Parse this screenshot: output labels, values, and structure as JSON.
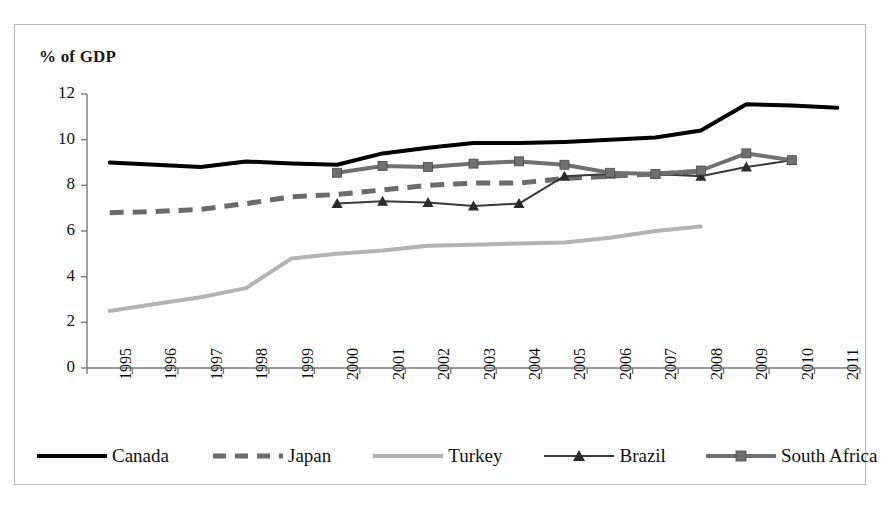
{
  "chart_data": {
    "type": "line",
    "title": "",
    "ylabel": "% of GDP",
    "xlabel": "",
    "ylim": [
      0,
      12
    ],
    "ytick_step": 2,
    "yticks": [
      "0",
      "2",
      "4",
      "6",
      "8",
      "10",
      "12"
    ],
    "grid": false,
    "legend_position": "bottom",
    "categories": [
      "1995",
      "1996",
      "1997",
      "1998",
      "1999",
      "2000",
      "2001",
      "2002",
      "2003",
      "2004",
      "2005",
      "2006",
      "2007",
      "2008",
      "2009",
      "2010",
      "2011"
    ],
    "series": [
      {
        "name": "Canada",
        "color": "#000000",
        "style": "solid",
        "marker": "none",
        "width": 4,
        "x": [
          "1995",
          "1996",
          "1997",
          "1998",
          "1999",
          "2000",
          "2001",
          "2002",
          "2003",
          "2004",
          "2005",
          "2006",
          "2007",
          "2008",
          "2009",
          "2010",
          "2011"
        ],
        "values": [
          9.0,
          8.9,
          8.8,
          9.05,
          8.95,
          8.9,
          9.4,
          9.65,
          9.85,
          9.85,
          9.9,
          10.0,
          10.1,
          10.4,
          11.55,
          11.5,
          11.4
        ]
      },
      {
        "name": "Japan",
        "color": "#6b6b6b",
        "style": "dashed",
        "marker": "none",
        "width": 5,
        "x": [
          "1995",
          "1996",
          "1997",
          "1998",
          "1999",
          "2000",
          "2001",
          "2002",
          "2003",
          "2004",
          "2005",
          "2006",
          "2007",
          "2008"
        ],
        "values": [
          6.8,
          6.85,
          6.95,
          7.2,
          7.5,
          7.6,
          7.8,
          8.0,
          8.1,
          8.1,
          8.3,
          8.4,
          8.5,
          8.6
        ]
      },
      {
        "name": "Turkey",
        "color": "#b3b3b3",
        "style": "solid",
        "marker": "none",
        "width": 4,
        "x": [
          "1995",
          "1996",
          "1997",
          "1998",
          "1999",
          "2000",
          "2001",
          "2002",
          "2003",
          "2004",
          "2005",
          "2006",
          "2007",
          "2008"
        ],
        "values": [
          2.5,
          2.8,
          3.1,
          3.5,
          4.8,
          5.0,
          5.15,
          5.35,
          5.4,
          5.45,
          5.5,
          5.7,
          6.0,
          6.2
        ]
      },
      {
        "name": "Brazil",
        "color": "#3a3a3a",
        "style": "solid",
        "marker": "triangle",
        "width": 2,
        "x": [
          "2000",
          "2001",
          "2002",
          "2003",
          "2004",
          "2005",
          "2006",
          "2007",
          "2008",
          "2009",
          "2010"
        ],
        "values": [
          7.2,
          7.3,
          7.25,
          7.1,
          7.2,
          8.4,
          8.5,
          8.5,
          8.4,
          8.8,
          9.1
        ]
      },
      {
        "name": "South Africa",
        "color": "#707070",
        "style": "solid",
        "marker": "square",
        "width": 4,
        "x": [
          "2000",
          "2001",
          "2002",
          "2003",
          "2004",
          "2005",
          "2006",
          "2007",
          "2008",
          "2009",
          "2010"
        ],
        "values": [
          8.55,
          8.85,
          8.8,
          8.95,
          9.05,
          8.9,
          8.55,
          8.5,
          8.65,
          9.4,
          9.1
        ]
      }
    ]
  },
  "legend": {
    "items": [
      {
        "label": "Canada"
      },
      {
        "label": "Japan"
      },
      {
        "label": "Turkey"
      },
      {
        "label": "Brazil"
      },
      {
        "label": "South Africa"
      }
    ]
  }
}
